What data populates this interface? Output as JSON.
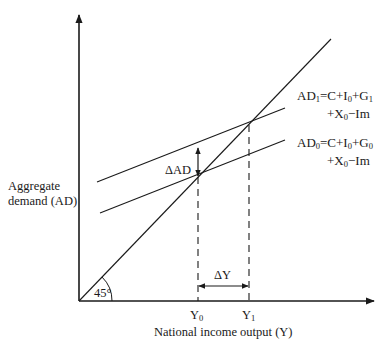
{
  "diagram": {
    "y_axis_label_line1": "Aggregate",
    "y_axis_label_line2": "demand (AD)",
    "x_axis_label": "National income output (Y)",
    "angle_label": "45°",
    "delta_ad_label": "ΔAD",
    "delta_y_label": "ΔY",
    "y0_label": "Y",
    "y0_sub": "0",
    "y1_label": "Y",
    "y1_sub": "1",
    "ad1": {
      "name": "AD",
      "sub": "1",
      "eq_line1_parts": [
        "=C+I",
        "0",
        "+G",
        "1"
      ],
      "eq_line2_parts": [
        "+X",
        "0",
        "−Im"
      ]
    },
    "ad0": {
      "name": "AD",
      "sub": "0",
      "eq_line1_parts": [
        "=C+I",
        "0",
        "+G",
        "0"
      ],
      "eq_line2_parts": [
        "+X",
        "0",
        "−Im"
      ]
    },
    "colors": {
      "line": "#1a1a1a",
      "background": "#ffffff"
    },
    "geometry": {
      "origin": [
        79,
        301
      ],
      "y_axis_top": 14,
      "x_axis_right": 374,
      "line_45_end": [
        331,
        39
      ],
      "ad1_line": [
        [
          97,
          182
        ],
        [
          285,
          108
        ]
      ],
      "ad0_line": [
        [
          100,
          213
        ],
        [
          285,
          140
        ]
      ],
      "eq_point_0": [
        198,
        177
      ],
      "eq_point_1": [
        249,
        125
      ]
    }
  }
}
